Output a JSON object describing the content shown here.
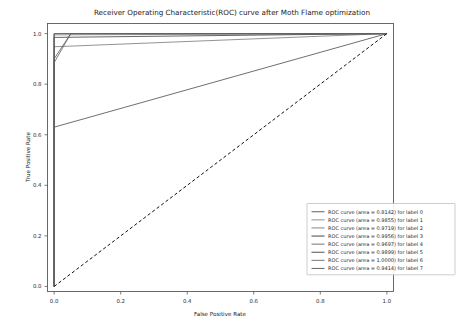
{
  "chart_data": {
    "type": "line",
    "title": "Receiver Operating Characteristic(ROC) curve after Moth Flame optimization",
    "xlabel": "False Positive Rate",
    "ylabel": "True Positive Rate",
    "xlim": [
      -0.02,
      1.02
    ],
    "ylim": [
      -0.02,
      1.04
    ],
    "xticks": [
      "0.0",
      "0.2",
      "0.4",
      "0.6",
      "0.8",
      "1.0"
    ],
    "xtick_values": [
      0.0,
      0.2,
      0.4,
      0.6,
      0.8,
      1.0
    ],
    "yticks": [
      "0.0",
      "0.2",
      "0.4",
      "0.6",
      "0.8",
      "1.0"
    ],
    "ytick_values": [
      0.0,
      0.2,
      0.4,
      0.6,
      0.8,
      1.0
    ],
    "grid": false,
    "legend_position": "lower right",
    "legend_entries": [
      "ROC curve (area = 0.8142) for label 0",
      "ROC curve (area = 0.9855) for label 1",
      "ROC curve (area = 0.9719) for label 2",
      "ROC curve (area = 0.9956) for label 3",
      "ROC curve (area = 0.9697) for label 4",
      "ROC curve (area = 0.9899) for label 5",
      "ROC curve (area = 1.0000) for label 6",
      "ROC curve (area = 0.9414) for label 7"
    ],
    "reference_line": {
      "label": "chance",
      "style": "dashed",
      "color": "#111111",
      "x": [
        0.0,
        1.0
      ],
      "y": [
        0.0,
        1.0
      ]
    },
    "series": [
      {
        "name": "ROC curve (area = 0.8142) for label 0",
        "auc": 0.8142,
        "color": "#555555",
        "x": [
          0.0,
          0.0,
          1.0
        ],
        "y": [
          0.0,
          0.63,
          1.0
        ]
      },
      {
        "name": "ROC curve (area = 0.9855) for label 1",
        "auc": 0.9855,
        "color": "#8c8c8c",
        "x": [
          0.0,
          0.0,
          1.0
        ],
        "y": [
          0.0,
          0.995,
          1.0
        ]
      },
      {
        "name": "ROC curve (area = 0.9719) for label 2",
        "auc": 0.9719,
        "color": "#7f7f7f",
        "x": [
          0.0,
          0.0,
          1.0
        ],
        "y": [
          0.0,
          0.948,
          1.0
        ]
      },
      {
        "name": "ROC curve (area = 0.9956) for label 3",
        "auc": 0.9956,
        "color": "#3d3d3d",
        "x": [
          0.0,
          0.0,
          1.0
        ],
        "y": [
          0.0,
          1.0,
          1.0
        ]
      },
      {
        "name": "ROC curve (area = 0.9697) for label 4",
        "auc": 0.9697,
        "color": "#6b6b6b",
        "x": [
          0.0,
          0.0,
          0.05,
          1.0
        ],
        "y": [
          0.0,
          0.885,
          1.0,
          1.0
        ]
      },
      {
        "name": "ROC curve (area = 0.9899) for label 5",
        "auc": 0.9899,
        "color": "#4a4a4a",
        "x": [
          0.0,
          0.0,
          1.0
        ],
        "y": [
          0.0,
          0.985,
          1.0
        ]
      },
      {
        "name": "ROC curve (area = 1.0000) for label 6",
        "auc": 1.0,
        "color": "#6f6f6f",
        "x": [
          0.0,
          0.0,
          1.0
        ],
        "y": [
          0.0,
          1.0,
          1.0
        ]
      },
      {
        "name": "ROC curve (area = 0.9414) for label 7",
        "auc": 0.9414,
        "color": "#5e5e5e",
        "x": [
          0.0,
          0.0,
          0.05,
          1.0
        ],
        "y": [
          0.0,
          0.9,
          1.0,
          1.0
        ]
      }
    ]
  },
  "figure": {
    "background_color": "#ffffff",
    "axes_edge_color": "#5a5a5a",
    "legend_border_color": "#b8b8b8"
  }
}
